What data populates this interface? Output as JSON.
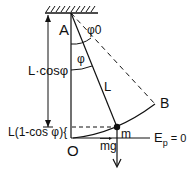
{
  "diagram": {
    "type": "pendulum-potential-energy",
    "labels": {
      "pivot": "A",
      "max_angle": "φ0",
      "angle": "φ",
      "length": "L",
      "extreme_point": "B",
      "vertical_height": "L·cosφ",
      "height_gain": "L(1-cos φ){",
      "origin": "O",
      "mass": "m",
      "weight": "mg",
      "zero_level": "Ep = 0",
      "ep_main": "E",
      "ep_sub": "p",
      "ep_rest": " = 0"
    },
    "colors": {
      "stroke": "#111111",
      "background": "#ffffff"
    }
  }
}
